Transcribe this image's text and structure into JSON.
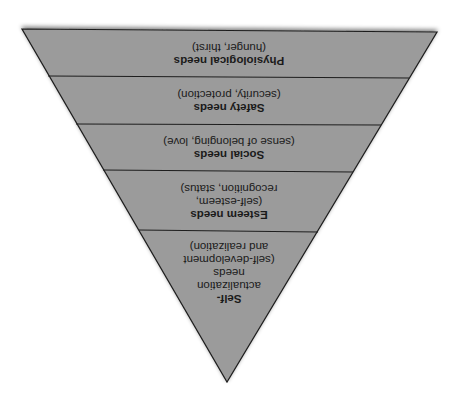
{
  "diagram": {
    "orientation": "rotated-180",
    "fill_color": "#9b9b9b",
    "line_color": "#1e1e1e",
    "background": "#ffffff",
    "levels": [
      {
        "title": "Physiological needs",
        "sub": "(hunger, thirst)"
      },
      {
        "title": "Safety needs",
        "sub": "(security, protection)"
      },
      {
        "title": "Social needs",
        "sub": "(sense of belonging, love)"
      },
      {
        "title": "Esteem needs",
        "sub1": "(self-esteem,",
        "sub2": "recognition, status)"
      },
      {
        "title1": "Self-",
        "title2": "actualization",
        "title3": "needs",
        "sub1": "(self-development",
        "sub2": "and realization)"
      }
    ]
  }
}
